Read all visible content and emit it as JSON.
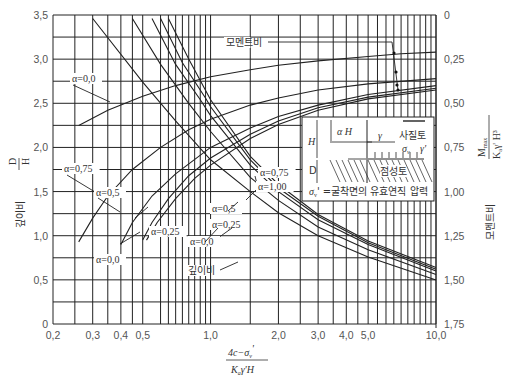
{
  "chart_data": {
    "type": "line",
    "title": "",
    "xlabel": "(4c − σv') / (Ka γ' H)",
    "xlabel_parts": {
      "numerator": "4c−σ",
      "numerator_sub": "v",
      "numerator_prime": "'",
      "denominator": "K",
      "denominator_sub": "a",
      "denominator_rest": "γ'H"
    },
    "ylabel_left": "깊이비 D/H",
    "ylabel_left_parts": {
      "korean": "깊이비",
      "num": "D",
      "den": "H"
    },
    "ylabel_right": "모멘트비 Mmax / (Ka γ' H³)",
    "ylabel_right_parts": {
      "korean": "모멘트비",
      "num": "M",
      "num_sub": "max",
      "den": "K",
      "den_sub": "a",
      "den_rest": "γ' H³"
    },
    "xscale": "log",
    "xlim": [
      0.2,
      10.0
    ],
    "ylim_left": [
      0,
      3.5
    ],
    "ylim_right": [
      1.75,
      0
    ],
    "grid": true,
    "x_ticks": [
      "0.2",
      "0.3",
      "0.4",
      "0.5",
      "1.0",
      "2.0",
      "3.0",
      "4.0",
      "5.0",
      "10.0"
    ],
    "x_tick_labels": [
      "0,2",
      "0,3",
      "0,4",
      "0,5",
      "1,0",
      "2,0",
      "3,0",
      "4,0",
      "5,0",
      "10,0"
    ],
    "y_left_tick_labels": [
      "0",
      "0,5",
      "1,0",
      "1,5",
      "2,0",
      "2,5",
      "3,0",
      "3,5"
    ],
    "y_right_tick_labels": [
      "0",
      "0,25",
      "0,50",
      "0,75",
      "1,00",
      "1,25",
      "1,50",
      "1,75"
    ],
    "depth_ratio_series": [
      {
        "name": "α=0.0",
        "axis": "left",
        "x": [
          0.26,
          0.35,
          0.5,
          0.7,
          1.0,
          1.5,
          2.0,
          3.0,
          5.0,
          7.0,
          10.0
        ],
        "y": [
          2.25,
          2.42,
          2.58,
          2.7,
          2.8,
          2.88,
          2.93,
          2.98,
          3.03,
          3.06,
          3.08
        ]
      },
      {
        "name": "α=0.75",
        "axis": "left",
        "x": [
          0.26,
          0.3,
          0.35,
          0.45,
          0.6,
          0.8,
          1.0,
          1.5,
          2.0,
          3.0,
          5.0,
          10.0
        ],
        "y": [
          0.93,
          1.2,
          1.45,
          1.75,
          2.0,
          2.2,
          2.32,
          2.48,
          2.56,
          2.65,
          2.72,
          2.78
        ]
      },
      {
        "name": "α=0.5",
        "axis": "left",
        "x": [
          0.4,
          0.45,
          0.55,
          0.7,
          1.0,
          1.5,
          2.0,
          3.0,
          5.0,
          10.0
        ],
        "y": [
          0.9,
          1.15,
          1.45,
          1.7,
          2.0,
          2.22,
          2.35,
          2.48,
          2.6,
          2.7
        ]
      },
      {
        "name": "α=0.25",
        "axis": "left",
        "x": [
          0.5,
          0.55,
          0.65,
          0.8,
          1.0,
          1.5,
          2.0,
          3.0,
          5.0,
          10.0
        ],
        "y": [
          0.95,
          1.15,
          1.42,
          1.68,
          1.88,
          2.15,
          2.3,
          2.45,
          2.57,
          2.67
        ]
      },
      {
        "name": "α=0.0 (lower)",
        "axis": "left",
        "x": [
          0.52,
          0.58,
          0.7,
          0.85,
          1.0,
          1.5,
          2.0,
          3.0,
          5.0,
          10.0
        ],
        "y": [
          0.95,
          1.15,
          1.42,
          1.65,
          1.8,
          2.1,
          2.26,
          2.42,
          2.55,
          2.65
        ]
      }
    ],
    "moment_ratio_series": [
      {
        "name": "α=0.0",
        "axis": "right",
        "x": [
          0.3,
          0.5,
          0.7,
          1.0,
          1.5,
          2.0,
          3.0,
          5.0,
          10.0
        ],
        "y": [
          0.02,
          0.38,
          0.6,
          0.82,
          1.0,
          1.12,
          1.25,
          1.37,
          1.5
        ]
      },
      {
        "name": "α=0.25",
        "axis": "right",
        "x": [
          0.45,
          0.6,
          0.8,
          1.0,
          1.5,
          2.0,
          3.0,
          5.0,
          10.0
        ],
        "y": [
          0.02,
          0.28,
          0.5,
          0.66,
          0.92,
          1.05,
          1.2,
          1.33,
          1.47
        ]
      },
      {
        "name": "α=0.5",
        "axis": "right",
        "x": [
          0.55,
          0.7,
          0.9,
          1.0,
          1.5,
          2.0,
          3.0,
          5.0,
          10.0
        ],
        "y": [
          0.02,
          0.28,
          0.48,
          0.57,
          0.85,
          1.0,
          1.16,
          1.3,
          1.45
        ]
      },
      {
        "name": "α=0.75",
        "axis": "right",
        "x": [
          0.6,
          0.75,
          0.95,
          1.0,
          1.5,
          2.0,
          3.0,
          5.0,
          10.0
        ],
        "y": [
          0.02,
          0.27,
          0.47,
          0.52,
          0.82,
          0.98,
          1.14,
          1.29,
          1.44
        ]
      },
      {
        "name": "α=1.00",
        "axis": "right",
        "x": [
          0.65,
          0.8,
          1.0,
          1.5,
          2.0,
          3.0,
          5.0,
          10.0
        ],
        "y": [
          0.02,
          0.25,
          0.48,
          0.8,
          0.96,
          1.13,
          1.28,
          1.43
        ]
      }
    ],
    "annotations": [
      {
        "text": "α=0,0",
        "target": "depth α=0.0"
      },
      {
        "text": "α=0,75",
        "target": "depth α=0.75"
      },
      {
        "text": "α=0,5",
        "target": "depth α=0.5"
      },
      {
        "text": "α=0,25",
        "target": "depth α=0.25"
      },
      {
        "text": "α=0,0",
        "target": "depth α=0.0 lower"
      },
      {
        "text": "α=0,75",
        "target": "moment α=0.75"
      },
      {
        "text": "α=1,00",
        "target": "moment α=1.00"
      },
      {
        "text": "α=0,5",
        "target": "moment α=0.5"
      },
      {
        "text": "α=0,25",
        "target": "moment α=0.25"
      },
      {
        "text": "α=0,0",
        "target": "moment α=0.0"
      },
      {
        "text": "모멘트비",
        "target": "moment curves"
      },
      {
        "text": "깊이비",
        "target": "depth curves"
      }
    ],
    "inset": {
      "labels": {
        "H": "H",
        "aH": "α H",
        "D": "D",
        "gamma": "γ",
        "sigma": "σ",
        "sigma_sub": "v",
        "gamma_prime": "γ'",
        "soil_top": "사질토",
        "soil_bottom": "점성토"
      },
      "caption": "σv' =굴착면의 유효연직 압력",
      "caption_parts": {
        "sigma": "σ",
        "sub": "v",
        "rest": "' =굴착면의 유효연직 압력"
      }
    }
  }
}
